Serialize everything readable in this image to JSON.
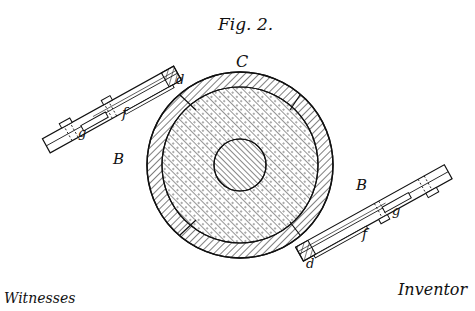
{
  "figure": {
    "title": "Fig. 2.",
    "type": "patent drawing",
    "labels": {
      "center": "C",
      "left_arm": "B",
      "right_arm": "B",
      "left_spring": "f",
      "right_spring": "f",
      "left_screw": "g",
      "right_screw": "g",
      "left_seat": "d",
      "right_seat": "d"
    },
    "footer": {
      "left": "Witnesses",
      "right": "Inventor"
    }
  },
  "colors": {
    "ink": "#111111",
    "paper": "#ffffff"
  }
}
